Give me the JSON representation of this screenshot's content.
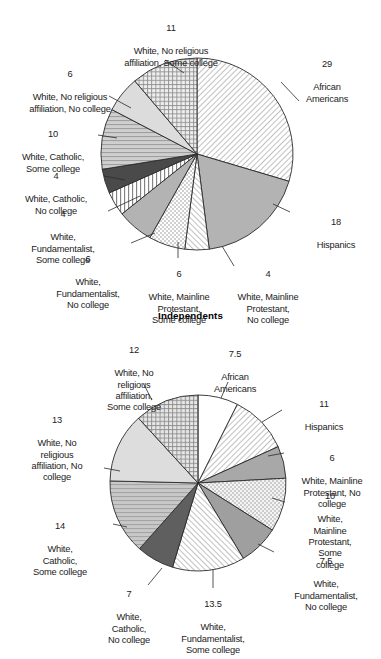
{
  "page": {
    "section_title": "Independents"
  },
  "chart_data": [
    {
      "id": "top-pie",
      "type": "pie",
      "title": "",
      "units": "percent",
      "start_angle_deg": 0,
      "direction": "clockwise",
      "center": [
        197,
        154
      ],
      "radius": 96,
      "categories": [
        "African Americans",
        "Hispanics",
        "White, Mainline Protestant, No college",
        "White, Mainline Protestant, Some college",
        "White, Fundamentalist, No college",
        "White, Fundamentalist, Some college",
        "White, Catholic, No college",
        "White, Catholic, Some college",
        "White, No religious affiliation, No college",
        "White, No religious affiliation, Some college"
      ],
      "values": [
        29,
        18,
        4,
        6,
        6,
        4,
        4,
        10,
        6,
        11
      ],
      "labels": [
        {
          "value": "29",
          "text": "African\nAmericans"
        },
        {
          "value": "18",
          "text": "Hispanics"
        },
        {
          "value": "4",
          "text": "White, Mainline\nProtestant,\nNo college"
        },
        {
          "value": "6",
          "text": "White, Mainline\nProtestant,\nSome college"
        },
        {
          "value": "6",
          "text": "White,\nFundamentalist,\nNo college"
        },
        {
          "value": "4",
          "text": "White,\nFundamentalist,\nSome college"
        },
        {
          "value": "4",
          "text": "White, Catholic,\nNo college"
        },
        {
          "value": "10",
          "text": "White, Catholic,\nSome college"
        },
        {
          "value": "6",
          "text": "White, No religious\naffiliation, No college"
        },
        {
          "value": "11",
          "text": "White, No religious\naffiliation, Some college"
        }
      ]
    },
    {
      "id": "bottom-pie",
      "type": "pie",
      "title": "Independents",
      "units": "percent",
      "start_angle_deg": 0,
      "direction": "clockwise",
      "center": [
        198,
        163
      ],
      "radius": 88,
      "categories": [
        "African Americans",
        "Hispanics",
        "White, Mainline Protestant, No college",
        "White, Mainline Protestant, Some college",
        "White, Fundamentalist, No college",
        "White, Fundamentalist, Some college",
        "White, Catholic, No college",
        "White, Catholic, Some college",
        "White, No religious affiliation, No college",
        "White, No religious affiliation, Some college"
      ],
      "values": [
        7.5,
        11,
        6,
        10,
        7.5,
        13.5,
        7,
        14,
        13,
        12
      ],
      "labels": [
        {
          "value": "7.5",
          "text": "African\nAmericans"
        },
        {
          "value": "11",
          "text": "Hispanics"
        },
        {
          "value": "6",
          "text": "White, Mainline\nProtestant, No\ncollege"
        },
        {
          "value": "10",
          "text": "White,\nMainline\nProtestant,\nSome\ncollege"
        },
        {
          "value": "7.5",
          "text": "White,\nFundamentalist,\nNo college"
        },
        {
          "value": "13.5",
          "text": "White,\nFundamentalist,\nSome college"
        },
        {
          "value": "7",
          "text": "White,\nCatholic,\nNo college"
        },
        {
          "value": "14",
          "text": "White,\nCatholic,\nSome college"
        },
        {
          "value": "13",
          "text": "White, No\nreligious\naffiliation, No\ncollege"
        },
        {
          "value": "12",
          "text": "White, No\nreligious\naffiliation,\nSome college"
        }
      ]
    }
  ],
  "colors": {
    "outline": "#2a2a2a",
    "text": "#1b1b1b",
    "background": "#ffffff",
    "fill_light": "#f2f2f2",
    "fill_mid": "#b9b9b9",
    "fill_dark": "#636363",
    "fill_white": "#ffffff"
  }
}
